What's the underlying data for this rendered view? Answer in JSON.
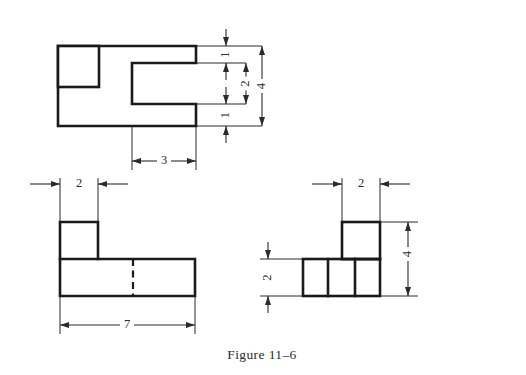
{
  "figure": {
    "caption": "Figure 11–6",
    "caption_x": 262,
    "caption_y": 356
  },
  "colors": {
    "object_line": "#1a1a1a",
    "hidden_line": "#1a1a1a",
    "dimension_line": "#2b2b2b",
    "background": "#ffffff"
  },
  "views": {
    "top": {
      "name": "top-view",
      "outline_points": "58,46 196,46 196,63 132,63 132,104 196,104 196,126 58,126 58,46",
      "inner_rect": {
        "x": 58,
        "y": 46,
        "w": 41,
        "h": 41
      },
      "inner_bottom_line": "58,87 99,87"
    },
    "front": {
      "name": "front-view",
      "outline_points": "60,222 98,222 98,259 195,259 195,296 60,296 60,222",
      "step_line": "60,259 98,259",
      "hidden_line": "133,259 133,296"
    },
    "side": {
      "name": "side-view",
      "base_rect": {
        "x": 303,
        "y": 259,
        "w": 77,
        "h": 37
      },
      "upper_rect": {
        "x": 342,
        "y": 222,
        "w": 38,
        "h": 37
      },
      "divider_1": "328,259 328,296",
      "divider_2": "355,259 355,296",
      "divider_3": "342,259 380,259"
    }
  },
  "dimensions": [
    {
      "id": "top-height-upper-1",
      "label": "1",
      "value": 1,
      "orientation": "vertical",
      "rotated": true,
      "text_x": 226,
      "text_y": 54.5,
      "dim_x": 226,
      "y_start": 46,
      "y_end": 63,
      "arrows": "outside",
      "ext_lines": [
        {
          "x1": 196,
          "y1": 46,
          "x2": 262,
          "y2": 46
        },
        {
          "x1": 196,
          "y1": 63,
          "x2": 246,
          "y2": 63
        }
      ]
    },
    {
      "id": "top-height-lower-1",
      "label": "1",
      "value": 1,
      "orientation": "vertical",
      "rotated": true,
      "text_x": 226,
      "text_y": 115,
      "dim_x": 226,
      "y_start": 104,
      "y_end": 126,
      "arrows": "outside",
      "ext_lines": [
        {
          "x1": 196,
          "y1": 104,
          "x2": 246,
          "y2": 104
        },
        {
          "x1": 196,
          "y1": 126,
          "x2": 262,
          "y2": 126
        }
      ]
    },
    {
      "id": "top-height-middle-2",
      "label": "2",
      "value": 2,
      "orientation": "vertical",
      "rotated": true,
      "text_x": 246,
      "text_y": 83.5,
      "dim_x": 246,
      "y_start": 63,
      "y_end": 104,
      "arrows": "inside",
      "ext_lines": []
    },
    {
      "id": "top-height-overall-4",
      "label": "4",
      "value": 4,
      "orientation": "vertical",
      "rotated": true,
      "text_x": 262,
      "text_y": 86,
      "dim_x": 262,
      "y_start": 46,
      "y_end": 126,
      "arrows": "inside",
      "ext_lines": []
    },
    {
      "id": "top-width-notch-3",
      "label": "3",
      "value": 3,
      "orientation": "horizontal",
      "rotated": false,
      "text_x": 164,
      "text_y": 161,
      "dim_y": 161,
      "x_start": 132,
      "x_end": 196,
      "arrows": "inside",
      "ext_lines": [
        {
          "x1": 132,
          "y1": 126,
          "x2": 132,
          "y2": 170
        },
        {
          "x1": 196,
          "y1": 126,
          "x2": 196,
          "y2": 170
        }
      ]
    },
    {
      "id": "front-width-step-2",
      "label": "2",
      "value": 2,
      "orientation": "horizontal",
      "rotated": false,
      "text_x": 79,
      "text_y": 184,
      "dim_y": 184,
      "x_start": 60,
      "x_end": 98,
      "arrows": "outside",
      "ext_lines": [
        {
          "x1": 60,
          "y1": 178,
          "x2": 60,
          "y2": 224
        },
        {
          "x1": 98,
          "y1": 178,
          "x2": 98,
          "y2": 224
        }
      ]
    },
    {
      "id": "front-width-overall-7",
      "label": "7",
      "value": 7,
      "orientation": "horizontal",
      "rotated": false,
      "text_x": 127,
      "text_y": 325,
      "dim_y": 325,
      "x_start": 60,
      "x_end": 195,
      "arrows": "inside",
      "ext_lines": [
        {
          "x1": 60,
          "y1": 296,
          "x2": 60,
          "y2": 334
        },
        {
          "x1": 195,
          "y1": 296,
          "x2": 195,
          "y2": 334
        }
      ]
    },
    {
      "id": "side-width-2",
      "label": "2",
      "value": 2,
      "orientation": "horizontal",
      "rotated": false,
      "text_x": 361,
      "text_y": 184,
      "dim_y": 184,
      "x_start": 342,
      "x_end": 380,
      "arrows": "outside",
      "ext_lines": [
        {
          "x1": 342,
          "y1": 178,
          "x2": 342,
          "y2": 224
        },
        {
          "x1": 380,
          "y1": 178,
          "x2": 380,
          "y2": 224
        }
      ]
    },
    {
      "id": "side-height-2",
      "label": "2",
      "value": 2,
      "orientation": "vertical",
      "rotated": true,
      "text_x": 268,
      "text_y": 277.5,
      "dim_x": 268,
      "y_start": 259,
      "y_end": 296,
      "arrows": "outside",
      "ext_lines": [
        {
          "x1": 260,
          "y1": 259,
          "x2": 305,
          "y2": 259
        },
        {
          "x1": 260,
          "y1": 296,
          "x2": 305,
          "y2": 296
        }
      ]
    },
    {
      "id": "side-height-overall-4",
      "label": "4",
      "value": 4,
      "orientation": "vertical",
      "rotated": true,
      "text_x": 408,
      "text_y": 254,
      "dim_x": 408,
      "y_start": 222,
      "y_end": 296,
      "arrows": "inside",
      "ext_lines": [
        {
          "x1": 380,
          "y1": 222,
          "x2": 418,
          "y2": 222
        },
        {
          "x1": 380,
          "y1": 296,
          "x2": 418,
          "y2": 296
        }
      ]
    }
  ]
}
